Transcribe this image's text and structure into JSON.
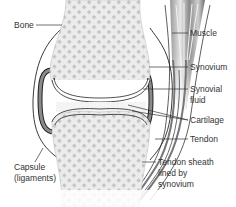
{
  "diagram": {
    "type": "anatomy",
    "colors": {
      "bone_fill": "#ececec",
      "bone_pattern": "#bdbdbd",
      "outline": "#222222",
      "synovium": "#6b6b6b",
      "muscle_dark": "#7a7a7a",
      "text": "#333333"
    },
    "labels": {
      "bone": "Bone",
      "muscle": "Muscle",
      "synovium": "Synovium",
      "synovial_fluid_1": "Synovial",
      "synovial_fluid_2": "fluid",
      "cartilage": "Cartilage",
      "tendon": "Tendon",
      "capsule_1": "Capsule",
      "capsule_2": "(ligaments)",
      "sheath_1": "Tendon sheath",
      "sheath_2": "lined by",
      "sheath_3": "synovium"
    }
  }
}
